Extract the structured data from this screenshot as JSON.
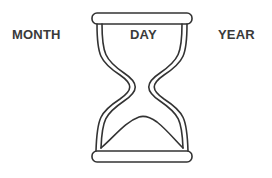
{
  "labels": {
    "month": "MONTH",
    "day": "DAY",
    "year": "YEAR"
  },
  "icons": {
    "center": "hourglass-icon"
  },
  "colors": {
    "stroke": "#333333",
    "text": "#3a3a3a",
    "background": "#ffffff"
  }
}
